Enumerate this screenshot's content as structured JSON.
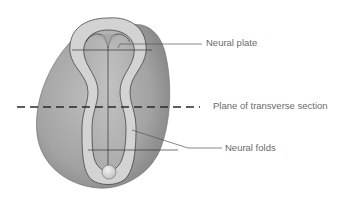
{
  "diagram": {
    "labels": [
      {
        "id": "neural-plate",
        "text": "Neural plate"
      },
      {
        "id": "plane-of-transverse-section",
        "text": "Plane of transverse section"
      },
      {
        "id": "neural-folds",
        "text": "Neural folds"
      }
    ],
    "colors": {
      "embryo_fill": "#a9a9a9",
      "embryo_shade": "#8e8e8e",
      "fold_fill": "#d4d4d4",
      "plate_fill": "#b3b3b3",
      "outline": "#3a3a3a",
      "leader_line": "#555555",
      "label_text": "#6a6a6a",
      "dashed_line": "#2a2a2a"
    }
  }
}
